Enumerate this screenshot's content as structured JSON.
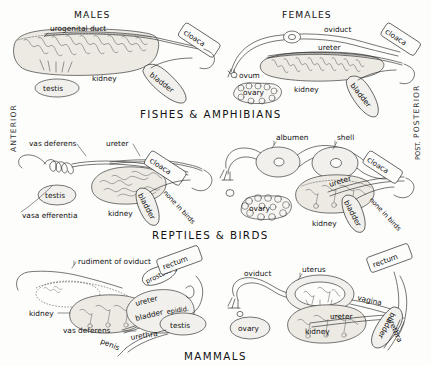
{
  "figure": {
    "orientation": {
      "anterior": "ANTERIOR",
      "posterior": "POSTERIOR",
      "posterior_short": "POST."
    },
    "column_headers": {
      "males": "MALES",
      "females": "FEMALES"
    },
    "sections": [
      {
        "id": "fishes-amphibians",
        "heading": "FISHES & AMPHIBIANS",
        "male_labels": [
          "urogenital duct",
          "testis",
          "kidney",
          "bladder",
          "cloaca"
        ],
        "female_labels": [
          "oviduct",
          "ureter",
          "ovum",
          "ovary",
          "kidney",
          "bladder",
          "cloaca"
        ]
      },
      {
        "id": "reptiles-birds",
        "heading": "REPTILES & BIRDS",
        "male_labels": [
          "vas deferens",
          "ureter",
          "testis",
          "kidney",
          "vasa efferentia",
          "bladder",
          "none in birds",
          "cloaca"
        ],
        "female_labels": [
          "albumen",
          "shell",
          "ureter",
          "ovary",
          "kidney",
          "bladder",
          "none in birds",
          "cloaca"
        ]
      },
      {
        "id": "mammals",
        "heading": "MAMMALS",
        "male_labels": [
          "rudiment of oviduct",
          "kidney",
          "vas deferens",
          "ureter",
          "bladder",
          "prostate g.",
          "rectum",
          "epidid.",
          "testis",
          "penis",
          "urethra"
        ],
        "female_labels": [
          "oviduct",
          "uterus",
          "rectum",
          "vagina",
          "ureter",
          "ovary",
          "kidney",
          "bladder",
          "urethra"
        ]
      }
    ],
    "colors": {
      "ink": "#1a1a1a",
      "paper": "#fdfdfc",
      "organ_fill": "#f2f0ec",
      "kidney_fill": "#edeae4"
    }
  }
}
